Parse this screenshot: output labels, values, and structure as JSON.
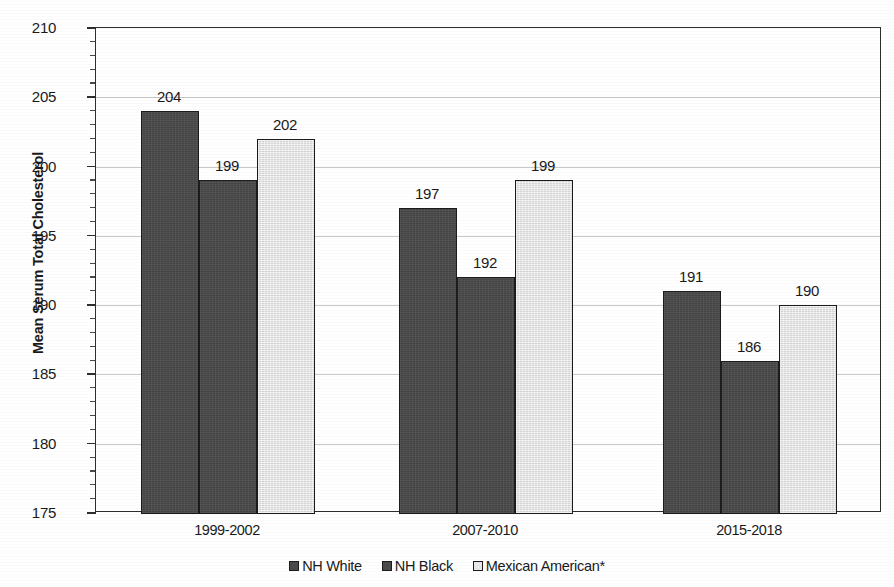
{
  "chart_data": {
    "type": "bar",
    "title": "",
    "xlabel": "",
    "ylabel": "Mean Serum Total Cholesterol",
    "ylim": [
      175,
      210
    ],
    "ytick_step": 5,
    "yminor_step": 1,
    "grid": true,
    "legend_position": "bottom",
    "categories": [
      "1999-2002",
      "2007-2010",
      "2015-2018"
    ],
    "yticks": [
      "210",
      "205",
      "200",
      "195",
      "190",
      "185",
      "180",
      "175"
    ],
    "series": [
      {
        "name": "NH White",
        "color": "#4a4a4a",
        "values": [
          204,
          197,
          191
        ],
        "labels": [
          "204",
          "197",
          "191"
        ]
      },
      {
        "name": "NH Black",
        "color": "#4a4a4a",
        "values": [
          199,
          192,
          186
        ],
        "labels": [
          "199",
          "192",
          "186"
        ]
      },
      {
        "name": "Mexican American*",
        "color": "#e4e4e4",
        "values": [
          202,
          199,
          190
        ],
        "labels": [
          "202",
          "199",
          "190"
        ]
      }
    ]
  },
  "colors": {
    "series_dark": "#4a4a4a",
    "series_light": "#e4e4e4",
    "axis": "#2e2e2e",
    "gridline": "#c8c8c8",
    "text": "#1a1a1a"
  }
}
